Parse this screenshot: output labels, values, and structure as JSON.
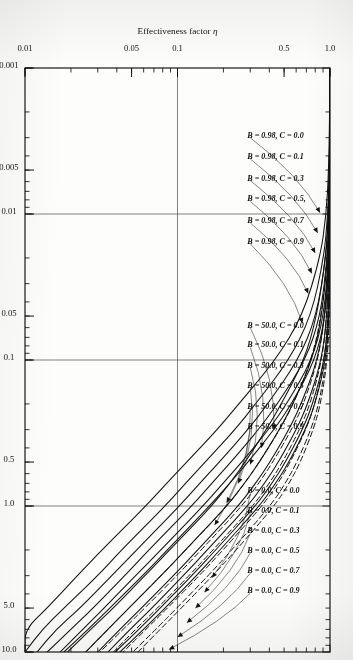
{
  "figure": {
    "orientation_note": "rotated-90-cw",
    "background": "#fdfdfc",
    "ink": "#111111"
  },
  "chart_data": {
    "type": "line",
    "title": "",
    "xlabel": "ΦL",
    "xlabel_main": "Φ",
    "xlabel_sub": "L",
    "ylabel": "Effectiveness factor η",
    "ylabel_main": "Effectiveness factor",
    "ylabel_sym": "η",
    "xscale": "log",
    "yscale": "log",
    "xlim": [
      0.001,
      10.0
    ],
    "ylim": [
      0.01,
      1.0
    ],
    "grid": false,
    "legend_position": "inline-labels-with-leader-lines",
    "xticks": [
      {
        "value": 0.001,
        "label": "0.001"
      },
      {
        "value": 0.005,
        "label": "0.005"
      },
      {
        "value": 0.01,
        "label": "0.01"
      },
      {
        "value": 0.05,
        "label": "0.05"
      },
      {
        "value": 0.1,
        "label": "0.1"
      },
      {
        "value": 0.5,
        "label": "0.5"
      },
      {
        "value": 1.0,
        "label": "1.0"
      },
      {
        "value": 5.0,
        "label": "5.0"
      },
      {
        "value": 10.0,
        "label": "10.0"
      }
    ],
    "yticks": [
      {
        "value": 1.0,
        "label": "1.0"
      },
      {
        "value": 0.5,
        "label": "0.5"
      },
      {
        "value": 0.1,
        "label": "0.1"
      },
      {
        "value": 0.05,
        "label": "0.05"
      },
      {
        "value": 0.01,
        "label": "0.01"
      }
    ],
    "reference_lines": [
      {
        "axis": "x",
        "value": 0.01
      },
      {
        "axis": "x",
        "value": 0.1
      },
      {
        "axis": "x",
        "value": 1.0
      },
      {
        "axis": "y",
        "value": 0.1
      }
    ],
    "series": [
      {
        "name": "B = 0.98, C = 0.0",
        "B": 0.98,
        "C": 0.0,
        "style": "solid",
        "x": [
          0.001,
          0.002,
          0.005,
          0.01,
          0.02,
          0.05,
          0.1,
          0.2,
          0.3,
          0.5,
          0.7,
          1.0,
          2.0,
          3.0,
          5.0,
          7.0,
          10.0
        ],
        "y": [
          1.0,
          1.0,
          1.0,
          0.999,
          0.997,
          0.984,
          0.94,
          0.8,
          0.69,
          0.54,
          0.44,
          0.345,
          0.19,
          0.133,
          0.083,
          0.06,
          0.042
        ]
      },
      {
        "name": "B = 0.98, C = 0.1",
        "B": 0.98,
        "C": 0.1,
        "style": "solid",
        "x": [
          0.001,
          0.002,
          0.005,
          0.01,
          0.02,
          0.05,
          0.1,
          0.2,
          0.3,
          0.5,
          0.7,
          1.0,
          2.0,
          3.0,
          5.0,
          7.0,
          10.0
        ],
        "y": [
          1.0,
          1.0,
          0.999,
          0.998,
          0.994,
          0.975,
          0.922,
          0.772,
          0.66,
          0.512,
          0.416,
          0.325,
          0.178,
          0.124,
          0.077,
          0.056,
          0.039
        ]
      },
      {
        "name": "B = 0.98, C = 0.3",
        "B": 0.98,
        "C": 0.3,
        "style": "solid",
        "x": [
          0.001,
          0.002,
          0.005,
          0.01,
          0.02,
          0.05,
          0.1,
          0.2,
          0.3,
          0.5,
          0.7,
          1.0,
          2.0,
          3.0,
          5.0,
          7.0,
          10.0
        ],
        "y": [
          1.0,
          1.0,
          0.999,
          0.996,
          0.988,
          0.955,
          0.882,
          0.715,
          0.602,
          0.46,
          0.372,
          0.289,
          0.157,
          0.109,
          0.068,
          0.049,
          0.035
        ]
      },
      {
        "name": "B = 0.98, C = 0.5",
        "B": 0.98,
        "C": 0.5,
        "style": "solid",
        "x": [
          0.001,
          0.002,
          0.005,
          0.01,
          0.02,
          0.05,
          0.1,
          0.2,
          0.3,
          0.5,
          0.7,
          1.0,
          2.0,
          3.0,
          5.0,
          7.0,
          10.0
        ],
        "y": [
          1.0,
          0.999,
          0.998,
          0.993,
          0.979,
          0.926,
          0.83,
          0.648,
          0.538,
          0.405,
          0.325,
          0.251,
          0.136,
          0.094,
          0.058,
          0.042,
          0.03
        ]
      },
      {
        "name": "B = 0.98, C = 0.7",
        "B": 0.98,
        "C": 0.7,
        "style": "solid",
        "x": [
          0.001,
          0.002,
          0.005,
          0.01,
          0.02,
          0.05,
          0.1,
          0.2,
          0.3,
          0.5,
          0.7,
          1.0,
          2.0,
          3.0,
          5.0,
          7.0,
          10.0
        ],
        "y": [
          1.0,
          0.999,
          0.996,
          0.988,
          0.965,
          0.884,
          0.766,
          0.572,
          0.466,
          0.345,
          0.275,
          0.211,
          0.113,
          0.078,
          0.048,
          0.035,
          0.025
        ]
      },
      {
        "name": "B = 0.98, C = 0.9",
        "B": 0.98,
        "C": 0.9,
        "style": "solid",
        "x": [
          0.001,
          0.002,
          0.005,
          0.01,
          0.02,
          0.05,
          0.1,
          0.2,
          0.3,
          0.5,
          0.7,
          1.0,
          2.0,
          3.0,
          5.0,
          7.0,
          10.0
        ],
        "y": [
          0.999,
          0.998,
          0.991,
          0.975,
          0.938,
          0.82,
          0.678,
          0.48,
          0.382,
          0.278,
          0.22,
          0.168,
          0.089,
          0.061,
          0.038,
          0.027,
          0.019
        ]
      },
      {
        "name": "B = 50.0, C = 0.0",
        "B": 50.0,
        "C": 0.0,
        "style": "solid",
        "x": [
          0.001,
          0.002,
          0.005,
          0.01,
          0.02,
          0.05,
          0.1,
          0.2,
          0.3,
          0.5,
          0.7,
          1.0,
          2.0,
          3.0,
          5.0,
          7.0,
          10.0
        ],
        "y": [
          1.0,
          1.0,
          0.999,
          0.996,
          0.986,
          0.935,
          0.8,
          0.56,
          0.43,
          0.29,
          0.22,
          0.162,
          0.086,
          0.059,
          0.036,
          0.026,
          0.018
        ]
      },
      {
        "name": "B = 50.0, C = 0.1",
        "B": 50.0,
        "C": 0.1,
        "style": "solid",
        "x": [
          0.001,
          0.002,
          0.005,
          0.01,
          0.02,
          0.05,
          0.1,
          0.2,
          0.3,
          0.5,
          0.7,
          1.0,
          2.0,
          3.0,
          5.0,
          7.0,
          10.0
        ],
        "y": [
          1.0,
          1.0,
          0.998,
          0.993,
          0.977,
          0.912,
          0.762,
          0.52,
          0.396,
          0.264,
          0.199,
          0.147,
          0.078,
          0.053,
          0.033,
          0.024,
          0.017
        ]
      },
      {
        "name": "B = 50.0, C = 0.3",
        "B": 50.0,
        "C": 0.3,
        "style": "solid",
        "x": [
          0.001,
          0.002,
          0.005,
          0.01,
          0.02,
          0.05,
          0.1,
          0.2,
          0.3,
          0.5,
          0.7,
          1.0,
          2.0,
          3.0,
          5.0,
          7.0,
          10.0
        ],
        "y": [
          1.0,
          0.999,
          0.996,
          0.987,
          0.96,
          0.866,
          0.692,
          0.452,
          0.34,
          0.224,
          0.168,
          0.124,
          0.065,
          0.045,
          0.028,
          0.02,
          0.014
        ]
      },
      {
        "name": "B = 50.0, C = 0.5",
        "B": 50.0,
        "C": 0.5,
        "style": "solid",
        "x": [
          0.001,
          0.002,
          0.005,
          0.01,
          0.02,
          0.05,
          0.1,
          0.2,
          0.3,
          0.5,
          0.7,
          1.0,
          2.0,
          3.0,
          5.0,
          7.0,
          10.0
        ],
        "y": [
          1.0,
          0.999,
          0.993,
          0.979,
          0.94,
          0.815,
          0.62,
          0.39,
          0.29,
          0.188,
          0.14,
          0.103,
          0.054,
          0.037,
          0.023,
          0.016,
          0.012
        ]
      },
      {
        "name": "B = 50.0, C = 0.7",
        "B": 50.0,
        "C": 0.7,
        "style": "solid",
        "x": [
          0.001,
          0.002,
          0.005,
          0.01,
          0.02,
          0.05,
          0.1,
          0.2,
          0.3,
          0.5,
          0.7,
          1.0,
          2.0,
          3.0,
          5.0,
          7.0,
          10.0
        ],
        "y": [
          0.999,
          0.998,
          0.989,
          0.968,
          0.912,
          0.752,
          0.54,
          0.325,
          0.238,
          0.152,
          0.113,
          0.083,
          0.043,
          0.03,
          0.018,
          0.013,
          0.01
        ]
      },
      {
        "name": "B = 50.0, C = 0.9",
        "B": 50.0,
        "C": 0.9,
        "style": "solid",
        "x": [
          0.001,
          0.002,
          0.005,
          0.01,
          0.02,
          0.05,
          0.1,
          0.2,
          0.3,
          0.5,
          0.7,
          1.0,
          2.0,
          3.0,
          5.0,
          7.0,
          10.0
        ],
        "y": [
          0.999,
          0.995,
          0.98,
          0.946,
          0.862,
          0.66,
          0.44,
          0.252,
          0.182,
          0.115,
          0.085,
          0.062,
          0.032,
          0.022,
          0.014,
          0.01,
          0.01
        ]
      },
      {
        "name": "B = 0.0, C = 0.0",
        "B": 0.0,
        "C": 0.0,
        "style": "dashed",
        "x": [
          0.001,
          0.002,
          0.005,
          0.01,
          0.02,
          0.05,
          0.1,
          0.2,
          0.3,
          0.5,
          0.7,
          1.0,
          2.0,
          3.0,
          5.0,
          7.0,
          10.0
        ],
        "y": [
          1.0,
          1.0,
          1.0,
          0.999,
          0.998,
          0.99,
          0.962,
          0.868,
          0.778,
          0.64,
          0.54,
          0.432,
          0.243,
          0.17,
          0.106,
          0.077,
          0.055
        ]
      },
      {
        "name": "B = 0.0, C = 0.1",
        "B": 0.0,
        "C": 0.1,
        "style": "dashed",
        "x": [
          0.001,
          0.002,
          0.005,
          0.01,
          0.02,
          0.05,
          0.1,
          0.2,
          0.3,
          0.5,
          0.7,
          1.0,
          2.0,
          3.0,
          5.0,
          7.0,
          10.0
        ],
        "y": [
          1.0,
          1.0,
          1.0,
          0.998,
          0.996,
          0.984,
          0.95,
          0.845,
          0.75,
          0.608,
          0.51,
          0.406,
          0.227,
          0.159,
          0.099,
          0.072,
          0.051
        ]
      },
      {
        "name": "B = 0.0, C = 0.3",
        "B": 0.0,
        "C": 0.3,
        "style": "dashed",
        "x": [
          0.001,
          0.002,
          0.005,
          0.01,
          0.02,
          0.05,
          0.1,
          0.2,
          0.3,
          0.5,
          0.7,
          1.0,
          2.0,
          3.0,
          5.0,
          7.0,
          10.0
        ],
        "y": [
          1.0,
          1.0,
          0.999,
          0.997,
          0.992,
          0.972,
          0.922,
          0.798,
          0.695,
          0.55,
          0.456,
          0.36,
          0.199,
          0.139,
          0.086,
          0.062,
          0.044
        ]
      },
      {
        "name": "B = 0.0, C = 0.5",
        "B": 0.0,
        "C": 0.5,
        "style": "dashed",
        "x": [
          0.001,
          0.002,
          0.005,
          0.01,
          0.02,
          0.05,
          0.1,
          0.2,
          0.3,
          0.5,
          0.7,
          1.0,
          2.0,
          3.0,
          5.0,
          7.0,
          10.0
        ],
        "y": [
          1.0,
          1.0,
          0.999,
          0.995,
          0.986,
          0.955,
          0.886,
          0.742,
          0.632,
          0.489,
          0.4,
          0.313,
          0.171,
          0.119,
          0.074,
          0.053,
          0.038
        ]
      },
      {
        "name": "B = 0.0, C = 0.7",
        "B": 0.0,
        "C": 0.7,
        "style": "dashed",
        "x": [
          0.001,
          0.002,
          0.005,
          0.01,
          0.02,
          0.05,
          0.1,
          0.2,
          0.3,
          0.5,
          0.7,
          1.0,
          2.0,
          3.0,
          5.0,
          7.0,
          10.0
        ],
        "y": [
          1.0,
          0.999,
          0.997,
          0.991,
          0.976,
          0.927,
          0.834,
          0.672,
          0.56,
          0.422,
          0.341,
          0.265,
          0.143,
          0.099,
          0.061,
          0.044,
          0.031
        ]
      },
      {
        "name": "B = 0.0, C = 0.9",
        "B": 0.0,
        "C": 0.9,
        "style": "dashed",
        "x": [
          0.001,
          0.002,
          0.005,
          0.01,
          0.02,
          0.05,
          0.1,
          0.2,
          0.3,
          0.5,
          0.7,
          1.0,
          2.0,
          3.0,
          5.0,
          7.0,
          10.0
        ],
        "y": [
          0.999,
          0.999,
          0.994,
          0.984,
          0.96,
          0.878,
          0.756,
          0.576,
          0.468,
          0.344,
          0.275,
          0.212,
          0.113,
          0.078,
          0.048,
          0.035,
          0.025
        ]
      }
    ],
    "annotations": [
      {
        "id": "a0",
        "text": "B = 0.98, C = 0.0",
        "group": "B098"
      },
      {
        "id": "a1",
        "text": "B = 0.98, C = 0.1",
        "group": "B098"
      },
      {
        "id": "a2",
        "text": "B = 0.98, C = 0.3",
        "group": "B098"
      },
      {
        "id": "a3",
        "text": "B = 0.98, C = 0.5,",
        "group": "B098"
      },
      {
        "id": "a4",
        "text": "B = 0.98, C = 0.7",
        "group": "B098"
      },
      {
        "id": "a5",
        "text": "B = 0.98, C = 0.9",
        "group": "B098"
      },
      {
        "id": "a6",
        "text": "B = 50.0, C = 0.0",
        "group": "B500"
      },
      {
        "id": "a7",
        "text": "B = 50.0, C = 0.1",
        "group": "B500"
      },
      {
        "id": "a8",
        "text": "B = 50.0, C = 0.3",
        "group": "B500"
      },
      {
        "id": "a9",
        "text": "B = 50.0, C = 0.5",
        "group": "B500"
      },
      {
        "id": "a10",
        "text": "B = 50.0, C = 0.7",
        "group": "B500"
      },
      {
        "id": "a11",
        "text": "B = 50.0, C = 0.9",
        "group": "B500"
      },
      {
        "id": "a12",
        "text": "B = 0.0, C = 0.0",
        "group": "B000"
      },
      {
        "id": "a13",
        "text": "B = 0.0, C = 0.1",
        "group": "B000"
      },
      {
        "id": "a14",
        "text": "B = 0.0, C = 0.3",
        "group": "B000"
      },
      {
        "id": "a15",
        "text": "B = 0.0, C = 0.5",
        "group": "B000"
      },
      {
        "id": "a16",
        "text": "B = 0.0, C = 0.7",
        "group": "B000"
      },
      {
        "id": "a17",
        "text": "B = 0.0, C = 0.9",
        "group": "B000"
      }
    ]
  }
}
